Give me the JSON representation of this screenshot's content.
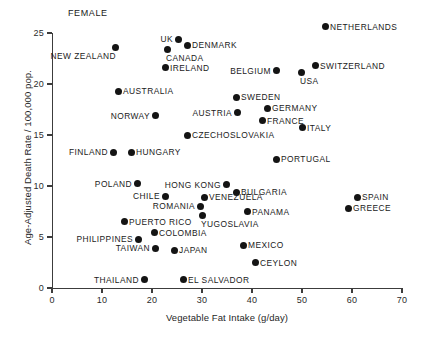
{
  "annotation": {
    "female": "FEMALE"
  },
  "axes": {
    "x": {
      "title": "Vegetable Fat Intake (g/day)",
      "ticks": [
        0,
        10,
        20,
        30,
        40,
        50,
        60,
        70
      ],
      "min": 0,
      "max": 70
    },
    "y": {
      "title": "Age-Adjusted Death Rate / 100,000 pop.",
      "ticks": [
        0,
        5,
        10,
        15,
        20,
        25
      ],
      "min": 0,
      "max": 26.6
    }
  },
  "chart_data": {
    "type": "scatter",
    "title": "",
    "xlabel": "Vegetable Fat Intake (g/day)",
    "ylabel": "Age-Adjusted Death Rate / 100,000 pop.",
    "xlim": [
      0,
      70
    ],
    "ylim": [
      0,
      26.6
    ],
    "grid": false,
    "legend": null,
    "annotations": [
      "FEMALE"
    ],
    "points": [
      {
        "label": "NETHERLANDS",
        "x": 54.6,
        "y": 25.6,
        "label_pos": "right"
      },
      {
        "label": "UK",
        "x": 25.2,
        "y": 24.4,
        "label_pos": "left"
      },
      {
        "label": "DENMARK",
        "x": 27.0,
        "y": 23.8,
        "label_pos": "right"
      },
      {
        "label": "NEW ZEALAND",
        "x": 12.6,
        "y": 23.6,
        "label_pos": "below-left"
      },
      {
        "label": "CANADA",
        "x": 23.0,
        "y": 23.4,
        "label_pos": "below"
      },
      {
        "label": "SWITZERLAND",
        "x": 52.6,
        "y": 21.8,
        "label_pos": "right"
      },
      {
        "label": "IRELAND",
        "x": 22.6,
        "y": 21.6,
        "label_pos": "right"
      },
      {
        "label": "BELGIUM",
        "x": 44.8,
        "y": 21.3,
        "label_pos": "left"
      },
      {
        "label": "USA",
        "x": 49.8,
        "y": 21.1,
        "label_pos": "below"
      },
      {
        "label": "AUSTRALIA",
        "x": 13.2,
        "y": 19.3,
        "label_pos": "right"
      },
      {
        "label": "SWEDEN",
        "x": 36.8,
        "y": 18.7,
        "label_pos": "right"
      },
      {
        "label": "GERMANY",
        "x": 43.0,
        "y": 17.6,
        "label_pos": "right"
      },
      {
        "label": "AUSTRIA",
        "x": 37.0,
        "y": 17.2,
        "label_pos": "left"
      },
      {
        "label": "NORWAY",
        "x": 20.6,
        "y": 16.9,
        "label_pos": "left"
      },
      {
        "label": "FRANCE",
        "x": 42.0,
        "y": 16.4,
        "label_pos": "right"
      },
      {
        "label": "ITALY",
        "x": 50.0,
        "y": 15.7,
        "label_pos": "right"
      },
      {
        "label": "CZECHOSLOVAKIA",
        "x": 27.0,
        "y": 15.0,
        "label_pos": "right"
      },
      {
        "label": "HUNGARY",
        "x": 15.8,
        "y": 13.3,
        "label_pos": "right"
      },
      {
        "label": "FINLAND",
        "x": 12.2,
        "y": 13.3,
        "label_pos": "left"
      },
      {
        "label": "PORTUGAL",
        "x": 44.8,
        "y": 12.6,
        "label_pos": "right"
      },
      {
        "label": "POLAND",
        "x": 17.0,
        "y": 10.2,
        "label_pos": "left"
      },
      {
        "label": "HONG KONG",
        "x": 34.8,
        "y": 10.1,
        "label_pos": "left"
      },
      {
        "label": "BULGARIA",
        "x": 36.8,
        "y": 9.4,
        "label_pos": "right"
      },
      {
        "label": "CHILE",
        "x": 22.6,
        "y": 9.0,
        "label_pos": "left"
      },
      {
        "label": "VENEZUELA",
        "x": 30.4,
        "y": 8.9,
        "label_pos": "right"
      },
      {
        "label": "SPAIN",
        "x": 61.0,
        "y": 8.9,
        "label_pos": "right"
      },
      {
        "label": "ROMANIA",
        "x": 29.6,
        "y": 8.0,
        "label_pos": "left"
      },
      {
        "label": "GREECE",
        "x": 59.2,
        "y": 7.8,
        "label_pos": "right"
      },
      {
        "label": "PANAMA",
        "x": 39.0,
        "y": 7.5,
        "label_pos": "right"
      },
      {
        "label": "YUGOSLAVIA",
        "x": 30.0,
        "y": 7.1,
        "label_pos": "below"
      },
      {
        "label": "PUERTO RICO",
        "x": 14.4,
        "y": 6.5,
        "label_pos": "right"
      },
      {
        "label": "COLOMBIA",
        "x": 20.4,
        "y": 5.4,
        "label_pos": "right"
      },
      {
        "label": "PHILIPPINES",
        "x": 17.2,
        "y": 4.8,
        "label_pos": "left"
      },
      {
        "label": "MEXICO",
        "x": 38.2,
        "y": 4.2,
        "label_pos": "right"
      },
      {
        "label": "TAIWAN",
        "x": 20.6,
        "y": 3.9,
        "label_pos": "left"
      },
      {
        "label": "JAPAN",
        "x": 24.4,
        "y": 3.7,
        "label_pos": "right"
      },
      {
        "label": "CEYLON",
        "x": 40.6,
        "y": 2.5,
        "label_pos": "right"
      },
      {
        "label": "THAILAND",
        "x": 18.4,
        "y": 0.8,
        "label_pos": "left"
      },
      {
        "label": "EL SALVADOR",
        "x": 26.2,
        "y": 0.8,
        "label_pos": "right"
      }
    ]
  }
}
